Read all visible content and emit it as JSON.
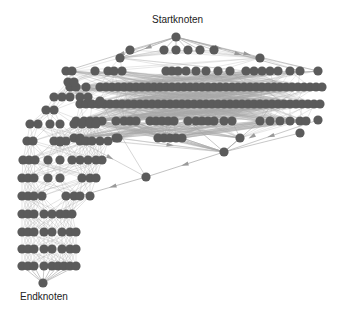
{
  "labels": {
    "start": "Startknoten",
    "end": "Endknoten"
  },
  "colors": {
    "node": "#5b5b5b",
    "edge": "#a8a8a8",
    "arrow": "#9a9a9a",
    "text": "#222222",
    "background": "#ffffff"
  },
  "graph": {
    "start_node": [
      176,
      37
    ],
    "end_node": [
      43,
      283
    ],
    "node_radius": 4.6,
    "rows_main": [
      {
        "y": 50,
        "xs": [
          130,
          164,
          176,
          188,
          200,
          214
        ]
      },
      {
        "y": 58,
        "xs": [
          120,
          260
        ]
      },
      {
        "y": 71,
        "xs": [
          66,
          72,
          95,
          108,
          114,
          122,
          166,
          172,
          178,
          186,
          196,
          206,
          218,
          230,
          246,
          254,
          262,
          270,
          278,
          290,
          300,
          318
        ]
      },
      {
        "y": 87,
        "xs": [
          70,
          76,
          86,
          100,
          106,
          112,
          118,
          124,
          130,
          136,
          142,
          148,
          154,
          160,
          166,
          172,
          178,
          184,
          190,
          196,
          202,
          208,
          214,
          220,
          226,
          232,
          238,
          244,
          250,
          256,
          262,
          268,
          274,
          280,
          286,
          292,
          298,
          304,
          310,
          316,
          322
        ]
      },
      {
        "y": 104,
        "xs": [
          80,
          86,
          92,
          98,
          104,
          110,
          116,
          122,
          128,
          134,
          140,
          146,
          152,
          158,
          164,
          170,
          176,
          182,
          188,
          194,
          200,
          206,
          212,
          218,
          224,
          230,
          236,
          242,
          248,
          254,
          260,
          266,
          272,
          278,
          284,
          290,
          296,
          302,
          308,
          314,
          320
        ]
      },
      {
        "y": 121,
        "xs": [
          76,
          84,
          90,
          96,
          102,
          116,
          124,
          130,
          136,
          150,
          156,
          162,
          168,
          174,
          188,
          196,
          202,
          208,
          214,
          224,
          232,
          260,
          270,
          280,
          290,
          300,
          306
        ]
      },
      {
        "y": 138,
        "xs": [
          74,
          80,
          116,
          158,
          164,
          170,
          176,
          182,
          240
        ]
      },
      {
        "y": 152,
        "xs": [
          224
        ]
      }
    ],
    "rows_left": [
      {
        "y": 82,
        "xs": [
          68,
          74
        ]
      },
      {
        "y": 97,
        "xs": [
          54,
          62,
          70,
          80,
          88
        ]
      },
      {
        "y": 110,
        "xs": [
          46,
          54
        ]
      },
      {
        "y": 124,
        "xs": [
          30,
          38,
          50,
          60,
          74,
          82,
          90,
          96
        ]
      },
      {
        "y": 141,
        "xs": [
          27,
          33,
          54,
          60,
          66,
          80,
          86,
          92,
          100,
          108
        ]
      },
      {
        "y": 160,
        "xs": [
          23,
          29,
          35,
          48,
          60,
          72,
          80,
          88,
          96,
          102
        ]
      },
      {
        "y": 178,
        "xs": [
          22,
          28,
          34,
          48,
          60,
          82,
          90,
          96
        ]
      },
      {
        "y": 196,
        "xs": [
          22,
          28,
          34,
          42,
          66,
          74,
          80,
          90
        ]
      },
      {
        "y": 214,
        "xs": [
          22,
          28,
          34,
          44,
          52,
          60,
          66,
          72
        ]
      },
      {
        "y": 232,
        "xs": [
          22,
          28,
          34,
          44,
          52,
          62,
          70,
          76
        ]
      },
      {
        "y": 249,
        "xs": [
          22,
          28,
          34,
          44,
          52,
          62,
          70,
          76
        ]
      },
      {
        "y": 266,
        "xs": [
          22,
          28,
          34,
          44,
          52,
          58,
          64,
          70,
          76
        ]
      }
    ],
    "extra_nodes": [
      [
        146,
        177
      ],
      [
        118,
        138
      ],
      [
        300,
        133
      ],
      [
        318,
        120
      ],
      [
        60,
        142
      ],
      [
        100,
        101
      ]
    ]
  }
}
